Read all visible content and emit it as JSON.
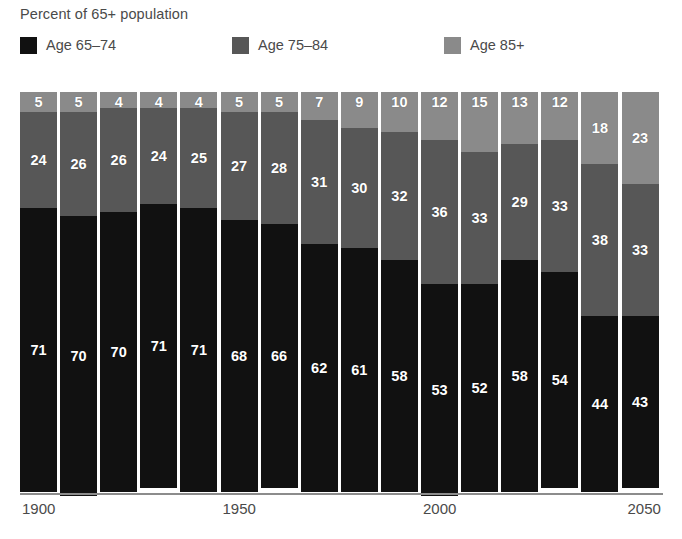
{
  "chart_data": {
    "type": "bar",
    "subtype": "stacked-bar-100-percent",
    "title": "Percent of 65+ population",
    "xlabel": "",
    "ylabel": "",
    "ylim": [
      0,
      100
    ],
    "grid": false,
    "legend_position": "top",
    "categories": [
      "1900",
      "1910",
      "1920",
      "1930",
      "1940",
      "1950",
      "1960",
      "1970",
      "1980",
      "1990",
      "2000",
      "2010",
      "2020",
      "2030",
      "2040",
      "2050"
    ],
    "axis_tick_labels": [
      "1900",
      "1950",
      "2000",
      "2050"
    ],
    "axis_tick_categories": [
      0,
      5,
      10,
      15
    ],
    "series": [
      {
        "name": "Age 65–74",
        "color": "#111111",
        "values": [
          71,
          70,
          70,
          71,
          71,
          68,
          66,
          62,
          61,
          58,
          53,
          52,
          58,
          54,
          44,
          43
        ]
      },
      {
        "name": "Age 75–84",
        "color": "#575757",
        "values": [
          24,
          26,
          26,
          24,
          25,
          27,
          28,
          31,
          30,
          32,
          36,
          33,
          29,
          33,
          38,
          33
        ]
      },
      {
        "name": "Age 85+",
        "color": "#8a8a8a",
        "values": [
          5,
          5,
          4,
          4,
          4,
          5,
          5,
          7,
          9,
          10,
          12,
          15,
          13,
          12,
          18,
          23
        ]
      }
    ]
  },
  "legend": {
    "items": [
      {
        "label": "Age 65–74",
        "swatch_name": "legend-swatch-age-65-74",
        "color": "#111111"
      },
      {
        "label": "Age 75–84",
        "swatch_name": "legend-swatch-age-75-84",
        "color": "#575757"
      },
      {
        "label": "Age 85+",
        "swatch_name": "legend-swatch-age-85-plus",
        "color": "#8a8a8a"
      }
    ]
  }
}
